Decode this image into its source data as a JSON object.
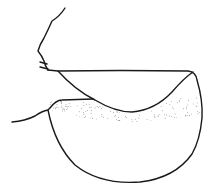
{
  "figure": {
    "stroke_color": "#1a1a1a",
    "background_color": "#ffffff",
    "stipple_color": "#555555"
  }
}
